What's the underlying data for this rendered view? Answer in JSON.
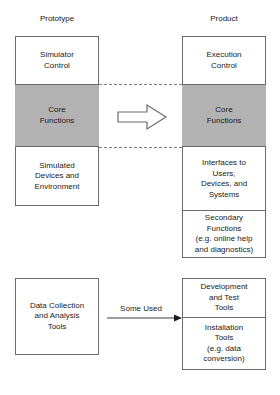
{
  "diagram": {
    "columns": {
      "left_header": "Prototype",
      "right_header": "Product"
    },
    "prototype_stack": {
      "segments": [
        {
          "id": "simulator-control",
          "label": "Simulator\nControl",
          "line1": "Simulator",
          "line2": "Control",
          "shaded": false
        },
        {
          "id": "core-functions",
          "label": "Core\nFunctions",
          "line1": "Core",
          "line2": "Functions",
          "shaded": true
        },
        {
          "id": "simulated-devices",
          "label": "Simulated\nDevices and\nEnvironment",
          "line1": "Simulated",
          "line2": "Devices and",
          "line3": "Environment",
          "shaded": false
        }
      ]
    },
    "product_stack": {
      "segments": [
        {
          "id": "execution-control",
          "label": "Execution\nControl",
          "line1": "Execution",
          "line2": "Control",
          "shaded": false
        },
        {
          "id": "core-functions",
          "label": "Core\nFunctions",
          "line1": "Core",
          "line2": "Functions",
          "shaded": true
        },
        {
          "id": "interfaces",
          "label": "Interfaces to\nUsers,\nDevices, and\nSystems",
          "line1": "Interfaces to",
          "line2": "Users,",
          "line3": "Devices, and",
          "line4": "Systems",
          "shaded": false
        },
        {
          "id": "secondary-functions",
          "label": "Secondary\nFunctions\n(e.g. online help\nand diagnostics)",
          "line1": "Secondary",
          "line2": "Functions",
          "line3": "(e.g. online help",
          "line4": "and diagnostics)",
          "shaded": false
        }
      ]
    },
    "tools_left": {
      "id": "data-collection-tools",
      "line1": "Data Collection",
      "line2": "and Analysis",
      "line3": "Tools"
    },
    "tools_right": {
      "segments": [
        {
          "id": "development-test-tools",
          "line1": "Development",
          "line2": "and Test",
          "line3": "Tools"
        },
        {
          "id": "installation-tools",
          "line1": "Installation",
          "line2": "Tools",
          "line3": "(e.g. data",
          "line4": "conversion)"
        }
      ]
    },
    "connectors": {
      "core_transfer_label": "",
      "tools_arrow_label": "Some Used"
    },
    "colors": {
      "shaded_fill": "#b2b2b2",
      "stroke": "#6b6b6b",
      "dashed_stroke": "#7d7d7d",
      "background": "#ffffff",
      "text": "#1a1a1a"
    }
  }
}
